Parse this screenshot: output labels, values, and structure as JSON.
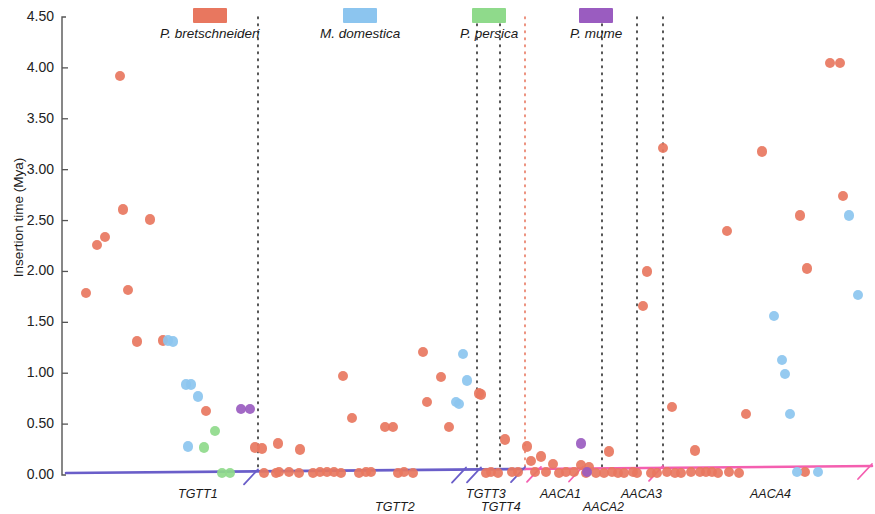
{
  "figure": {
    "plot_left": 62,
    "plot_right": 872,
    "plot_top": 17,
    "plot_bottom": 475
  },
  "legend": {
    "items": [
      {
        "label": "P. bretschneideri",
        "color": "#e8775f",
        "x": 40
      },
      {
        "label": "M. domestica",
        "color": "#8cc5ef",
        "x": 200
      },
      {
        "label": "P. persica",
        "color": "#8fda8b",
        "x": 340
      },
      {
        "label": "P. mume",
        "color": "#9a5cc0",
        "x": 450
      }
    ]
  },
  "axis": {
    "y_title": "Insertion time (Mya)",
    "y_ticks": [
      "0.00",
      "0.50",
      "1.00",
      "1.50",
      "2.00",
      "2.50",
      "3.00",
      "3.50",
      "4.00",
      "4.50"
    ],
    "y_tick_values": [
      0.0,
      0.5,
      1.0,
      1.5,
      2.0,
      2.5,
      3.0,
      3.5,
      4.0,
      4.5
    ]
  },
  "groups": [
    {
      "label": "TGTT1",
      "x": 178,
      "y": 487
    },
    {
      "label": "TGTT2",
      "x": 375,
      "y": 500
    },
    {
      "label": "TGTT3",
      "x": 466,
      "y": 487
    },
    {
      "label": "TGTT4",
      "x": 481,
      "y": 500
    },
    {
      "label": "AACA1",
      "x": 540,
      "y": 487
    },
    {
      "label": "AACA2",
      "x": 583,
      "y": 500
    },
    {
      "label": "AACA3",
      "x": 621,
      "y": 487
    },
    {
      "label": "AACA4",
      "x": 750,
      "y": 487
    }
  ],
  "dividers": {
    "color": "#2b2b2b",
    "highlight_color": "#e8775f",
    "x_positions": [
      258,
      477,
      500,
      525,
      602,
      637,
      663
    ],
    "highlight_index": 3,
    "y_top": 17,
    "y_bottom": 472
  },
  "baseline": {
    "purple_color": "#6a5ec9",
    "pink_color": "#f45fb0",
    "purple_x_start": 66,
    "purple_x_end": 525,
    "pink_x_start": 525,
    "pink_x_end": 872,
    "y_left": 473,
    "y_right": 466,
    "ticks_x": [
      258,
      466,
      481,
      525,
      583,
      663
    ]
  },
  "chart_data": {
    "type": "scatter",
    "title": "",
    "xlabel": "",
    "ylabel": "Insertion time (Mya)",
    "ylim": [
      0.0,
      4.5
    ],
    "grid": false,
    "legend_position": "top",
    "series": [
      {
        "name": "P. bretschneideri",
        "color": "#e8775f",
        "points": [
          [
            86,
            1.79
          ],
          [
            97,
            2.26
          ],
          [
            105,
            2.34
          ],
          [
            120,
            3.92
          ],
          [
            123,
            2.61
          ],
          [
            128,
            1.82
          ],
          [
            137,
            1.31
          ],
          [
            150,
            2.51
          ],
          [
            163,
            1.32
          ],
          [
            206,
            0.63
          ],
          [
            255,
            0.27
          ],
          [
            262,
            0.26
          ],
          [
            264,
            0.02
          ],
          [
            276,
            0.02
          ],
          [
            278,
            0.31
          ],
          [
            279,
            0.03
          ],
          [
            289,
            0.03
          ],
          [
            299,
            0.02
          ],
          [
            300,
            0.25
          ],
          [
            313,
            0.02
          ],
          [
            320,
            0.03
          ],
          [
            327,
            0.03
          ],
          [
            334,
            0.03
          ],
          [
            341,
            0.02
          ],
          [
            343,
            0.97
          ],
          [
            352,
            0.56
          ],
          [
            359,
            0.02
          ],
          [
            366,
            0.03
          ],
          [
            371,
            0.03
          ],
          [
            385,
            0.47
          ],
          [
            393,
            0.47
          ],
          [
            398,
            0.02
          ],
          [
            404,
            0.03
          ],
          [
            413,
            0.02
          ],
          [
            423,
            1.21
          ],
          [
            427,
            0.72
          ],
          [
            441,
            0.96
          ],
          [
            449,
            0.47
          ],
          [
            479,
            0.8
          ],
          [
            481,
            0.79
          ],
          [
            486,
            0.02
          ],
          [
            491,
            0.03
          ],
          [
            498,
            0.02
          ],
          [
            505,
            0.35
          ],
          [
            512,
            0.03
          ],
          [
            518,
            0.03
          ],
          [
            527,
            0.28
          ],
          [
            531,
            0.14
          ],
          [
            535,
            0.03
          ],
          [
            541,
            0.18
          ],
          [
            546,
            0.03
          ],
          [
            553,
            0.11
          ],
          [
            559,
            0.02
          ],
          [
            566,
            0.03
          ],
          [
            574,
            0.03
          ],
          [
            581,
            0.1
          ],
          [
            586,
            0.02
          ],
          [
            589,
            0.08
          ],
          [
            596,
            0.02
          ],
          [
            604,
            0.02
          ],
          [
            609,
            0.23
          ],
          [
            612,
            0.03
          ],
          [
            618,
            0.02
          ],
          [
            624,
            0.02
          ],
          [
            633,
            0.03
          ],
          [
            637,
            0.02
          ],
          [
            643,
            1.66
          ],
          [
            647,
            2.0
          ],
          [
            651,
            0.02
          ],
          [
            657,
            0.02
          ],
          [
            663,
            3.21
          ],
          [
            667,
            0.03
          ],
          [
            672,
            0.67
          ],
          [
            675,
            0.02
          ],
          [
            681,
            0.02
          ],
          [
            691,
            0.03
          ],
          [
            695,
            0.24
          ],
          [
            700,
            0.03
          ],
          [
            706,
            0.03
          ],
          [
            712,
            0.03
          ],
          [
            718,
            0.02
          ],
          [
            727,
            2.4
          ],
          [
            729,
            0.03
          ],
          [
            739,
            0.02
          ],
          [
            746,
            0.6
          ],
          [
            762,
            3.18
          ],
          [
            800,
            2.55
          ],
          [
            805,
            0.03
          ],
          [
            807,
            2.03
          ],
          [
            830,
            4.05
          ],
          [
            840,
            4.05
          ],
          [
            843,
            2.74
          ]
        ]
      },
      {
        "name": "M. domestica",
        "color": "#8cc5ef",
        "points": [
          [
            168,
            1.32
          ],
          [
            173,
            1.31
          ],
          [
            186,
            0.89
          ],
          [
            191,
            0.89
          ],
          [
            198,
            0.77
          ],
          [
            463,
            1.19
          ],
          [
            467,
            0.93
          ],
          [
            459,
            0.7
          ],
          [
            456,
            0.72
          ],
          [
            188,
            0.28
          ],
          [
            774,
            1.56
          ],
          [
            782,
            1.13
          ],
          [
            785,
            0.99
          ],
          [
            790,
            0.6
          ],
          [
            797,
            0.03
          ],
          [
            818,
            0.03
          ],
          [
            849,
            2.55
          ],
          [
            858,
            1.77
          ]
        ]
      },
      {
        "name": "P. persica",
        "color": "#8fda8b",
        "points": [
          [
            204,
            0.27
          ],
          [
            215,
            0.43
          ],
          [
            222,
            0.02
          ],
          [
            230,
            0.02
          ]
        ]
      },
      {
        "name": "P. mume",
        "color": "#9a5cc0",
        "points": [
          [
            241,
            0.65
          ],
          [
            250,
            0.65
          ],
          [
            581,
            0.31
          ],
          [
            587,
            0.03
          ]
        ]
      }
    ]
  }
}
